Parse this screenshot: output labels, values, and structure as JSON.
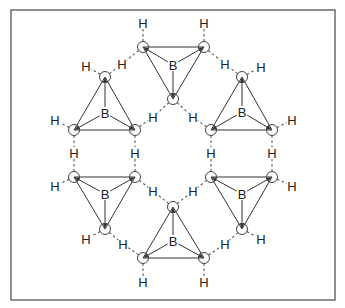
{
  "colors": {
    "line": "#333333",
    "frame": "#555555",
    "background": "#ffffff"
  },
  "frame": {
    "x": 11,
    "y": 10,
    "w": 324,
    "h": 290
  },
  "molecules": [
    {
      "name": "top",
      "b": [
        173,
        65
      ],
      "atoms": [
        [
          143,
          47
        ],
        [
          204,
          47
        ],
        [
          173,
          99
        ]
      ]
    },
    {
      "name": "upper-left",
      "b": [
        105,
        113
      ],
      "atoms": [
        [
          105,
          77
        ],
        [
          74,
          130
        ],
        [
          135,
          130
        ]
      ]
    },
    {
      "name": "upper-right",
      "b": [
        242,
        112
      ],
      "atoms": [
        [
          242,
          77
        ],
        [
          211,
          130
        ],
        [
          272,
          130
        ]
      ]
    },
    {
      "name": "lower-left",
      "b": [
        105,
        194
      ],
      "atoms": [
        [
          74,
          177
        ],
        [
          135,
          177
        ],
        [
          105,
          229
        ]
      ]
    },
    {
      "name": "lower-right",
      "b": [
        242,
        194
      ],
      "atoms": [
        [
          211,
          177
        ],
        [
          272,
          177
        ],
        [
          242,
          229
        ]
      ]
    },
    {
      "name": "bottom",
      "b": [
        173,
        241
      ],
      "atoms": [
        [
          173,
          207
        ],
        [
          143,
          258
        ],
        [
          204,
          258
        ]
      ]
    }
  ],
  "b_label": "B",
  "h_label": "H",
  "terminal_h": [
    {
      "pos": [
        143,
        23
      ],
      "from": [
        143,
        47
      ]
    },
    {
      "pos": [
        204,
        23
      ],
      "from": [
        204,
        47
      ]
    },
    {
      "pos": [
        86,
        66
      ],
      "from": [
        105,
        77
      ]
    },
    {
      "pos": [
        261,
        67
      ],
      "from": [
        242,
        77
      ]
    },
    {
      "pos": [
        55,
        120
      ],
      "from": [
        74,
        130
      ]
    },
    {
      "pos": [
        292,
        120
      ],
      "from": [
        272,
        130
      ]
    },
    {
      "pos": [
        55,
        186
      ],
      "from": [
        74,
        177
      ]
    },
    {
      "pos": [
        292,
        186
      ],
      "from": [
        272,
        177
      ]
    },
    {
      "pos": [
        86,
        239
      ],
      "from": [
        105,
        229
      ]
    },
    {
      "pos": [
        261,
        239
      ],
      "from": [
        242,
        229
      ]
    },
    {
      "pos": [
        143,
        282
      ],
      "from": [
        143,
        258
      ]
    },
    {
      "pos": [
        204,
        282
      ],
      "from": [
        204,
        258
      ]
    }
  ],
  "bridging_h": [
    {
      "pos": [
        122,
        64
      ],
      "a": [
        143,
        47
      ],
      "b": [
        105,
        77
      ]
    },
    {
      "pos": [
        225,
        64
      ],
      "a": [
        204,
        47
      ],
      "b": [
        242,
        77
      ]
    },
    {
      "pos": [
        153,
        117
      ],
      "a": [
        173,
        99
      ],
      "b": [
        135,
        130
      ]
    },
    {
      "pos": [
        193,
        117
      ],
      "a": [
        173,
        99
      ],
      "b": [
        211,
        130
      ]
    },
    {
      "pos": [
        74,
        153
      ],
      "a": [
        74,
        130
      ],
      "b": [
        74,
        177
      ]
    },
    {
      "pos": [
        135,
        153
      ],
      "a": [
        135,
        130
      ],
      "b": [
        135,
        177
      ]
    },
    {
      "pos": [
        211,
        153
      ],
      "a": [
        211,
        130
      ],
      "b": [
        211,
        177
      ]
    },
    {
      "pos": [
        272,
        153
      ],
      "a": [
        272,
        130
      ],
      "b": [
        272,
        177
      ]
    },
    {
      "pos": [
        153,
        191
      ],
      "a": [
        135,
        177
      ],
      "b": [
        173,
        207
      ]
    },
    {
      "pos": [
        193,
        191
      ],
      "a": [
        211,
        177
      ],
      "b": [
        173,
        207
      ]
    },
    {
      "pos": [
        123,
        244
      ],
      "a": [
        105,
        229
      ],
      "b": [
        143,
        258
      ]
    },
    {
      "pos": [
        225,
        244
      ],
      "a": [
        242,
        229
      ],
      "b": [
        204,
        258
      ]
    }
  ]
}
